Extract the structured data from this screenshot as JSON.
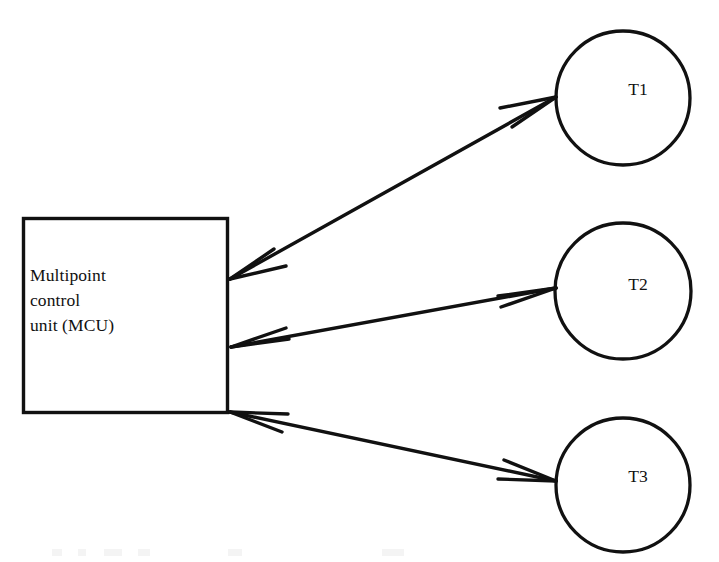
{
  "diagram": {
    "type": "node-link-diagram",
    "canvas": {
      "width": 719,
      "height": 562,
      "background": "#ffffff"
    },
    "stroke_color": "#111111",
    "nodes": [
      {
        "id": "mcu",
        "shape": "rectangle",
        "label": "Multipoint\ncontrol\nunit (MCU)",
        "x": 23,
        "y": 218,
        "width": 204,
        "height": 194
      },
      {
        "id": "t1",
        "shape": "circle",
        "label": "T1",
        "cx": 623,
        "cy": 98,
        "r": 67
      },
      {
        "id": "t2",
        "shape": "circle",
        "label": "T2",
        "cx": 623,
        "cy": 291,
        "r": 68
      },
      {
        "id": "t3",
        "shape": "circle",
        "label": "T3",
        "cx": 623,
        "cy": 485,
        "r": 67
      }
    ],
    "edges": [
      {
        "id": "mcu-t1",
        "from": "mcu",
        "to": "t1",
        "direction": "bidirectional",
        "arrowheads": "both",
        "x1": 230,
        "y1": 279,
        "x2": 556,
        "y2": 97
      },
      {
        "id": "mcu-t2",
        "from": "mcu",
        "to": "t2",
        "direction": "bidirectional",
        "arrowheads": "both",
        "x1": 231,
        "y1": 347,
        "x2": 556,
        "y2": 288
      },
      {
        "id": "mcu-t3",
        "from": "mcu",
        "to": "t3",
        "direction": "bidirectional",
        "arrowheads": "both",
        "x1": 230,
        "y1": 412,
        "x2": 556,
        "y2": 481
      }
    ]
  }
}
